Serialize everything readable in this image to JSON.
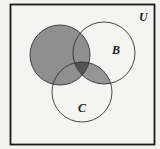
{
  "diagram": {
    "type": "venn",
    "universe_label": "U",
    "sets": [
      {
        "id": "A",
        "label": "",
        "cx": 60,
        "cy": 55,
        "r": 30
      },
      {
        "id": "B",
        "label": "B",
        "cx": 104,
        "cy": 53,
        "r": 31
      },
      {
        "id": "C",
        "label": "C",
        "cx": 82,
        "cy": 92,
        "r": 30
      }
    ],
    "shaded_region": "A ∪ (B ∩ C)",
    "darker_region": "A ∩ B ∩ C",
    "colors": {
      "background": "#f2f2f0",
      "border": "#1a1a1a",
      "shade": "#8f8f8f",
      "dark_shade": "#555555",
      "outline": "#333333"
    }
  }
}
